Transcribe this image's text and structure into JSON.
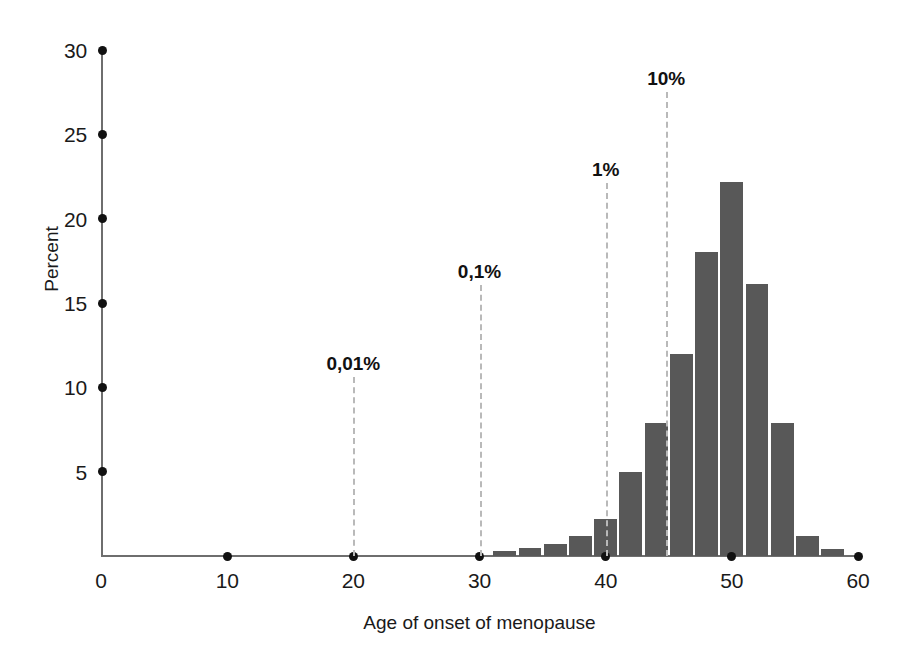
{
  "chart_data": {
    "type": "bar",
    "title": "",
    "subtitle": "",
    "xlabel": "Age of onset of menopause",
    "ylabel": "Percent",
    "xlim": [
      0,
      60
    ],
    "ylim": [
      0,
      30
    ],
    "grid": false,
    "legend": null,
    "bar_color": "#585858",
    "annotation_line_color": "#b9b9b9",
    "axis_color": "#6e6e6e",
    "x_ticks": [
      {
        "value": 0,
        "label": "0"
      },
      {
        "value": 10,
        "label": "10"
      },
      {
        "value": 20,
        "label": "20"
      },
      {
        "value": 30,
        "label": "30"
      },
      {
        "value": 40,
        "label": "40"
      },
      {
        "value": 50,
        "label": "50"
      },
      {
        "value": 60,
        "label": "60"
      }
    ],
    "y_ticks": [
      {
        "value": 5,
        "label": "5"
      },
      {
        "value": 10,
        "label": "10"
      },
      {
        "value": 15,
        "label": "15"
      },
      {
        "value": 20,
        "label": "20"
      },
      {
        "value": 25,
        "label": "25"
      },
      {
        "value": 30,
        "label": "30"
      }
    ],
    "bin_width": 2,
    "bars": [
      {
        "x_left": 31,
        "x_right": 33,
        "value": 0.3
      },
      {
        "x_left": 33,
        "x_right": 35,
        "value": 0.5
      },
      {
        "x_left": 35,
        "x_right": 37,
        "value": 0.7
      },
      {
        "x_left": 37,
        "x_right": 39,
        "value": 1.2
      },
      {
        "x_left": 39,
        "x_right": 41,
        "value": 2.2
      },
      {
        "x_left": 41,
        "x_right": 43,
        "value": 5.0
      },
      {
        "x_left": 43,
        "x_right": 45,
        "value": 7.9
      },
      {
        "x_left": 45,
        "x_right": 47,
        "value": 12.0
      },
      {
        "x_left": 47,
        "x_right": 49,
        "value": 18.0
      },
      {
        "x_left": 49,
        "x_right": 51,
        "value": 22.2
      },
      {
        "x_left": 51,
        "x_right": 53,
        "value": 16.1
      },
      {
        "x_left": 53,
        "x_right": 55,
        "value": 7.9
      },
      {
        "x_left": 55,
        "x_right": 57,
        "value": 1.2
      },
      {
        "x_left": 57,
        "x_right": 59,
        "value": 0.4
      }
    ],
    "annotations": [
      {
        "label": "0,01%",
        "x": 20,
        "label_y_percent": 11.9
      },
      {
        "label": "0,1%",
        "x": 30,
        "label_y_percent": 17.4
      },
      {
        "label": "1%",
        "x": 40,
        "label_y_percent": 23.4
      },
      {
        "label": "10%",
        "x": 44.8,
        "label_y_percent": 28.8
      }
    ]
  }
}
